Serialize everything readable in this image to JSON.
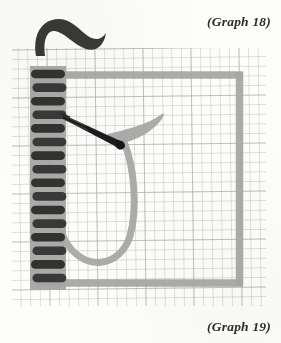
{
  "figure": {
    "kind": "embroidery-stitch-diagram",
    "label_top": "(Graph 18)",
    "label_bottom": "(Graph 19)",
    "background_color": "#fdfdfc"
  },
  "grid": {
    "x": 12,
    "y": 48,
    "width": 254,
    "height": 258,
    "cell": 9.6,
    "line_color": "#b9b8b6",
    "line_color_strong": "#9a9997"
  },
  "frame": {
    "name": "gray-thread-frame",
    "color": "#a9a8a6",
    "stroke_width": 7,
    "left": 36,
    "top": 72,
    "right": 243,
    "bottom": 285
  },
  "stitch_column": {
    "name": "blanket-stitch-column",
    "band_color": "#a9a8a6",
    "stitch_color": "#2b2a28",
    "band_x": 30,
    "band_width": 36,
    "band_top": 66,
    "band_bottom": 290,
    "count": 16,
    "first_y": 74,
    "spacing": 13.6,
    "stitch_width": 34,
    "stitch_height": 8.6
  },
  "needle": {
    "name": "sewing-needle",
    "color": "#1d1c1b",
    "eye_color": "#3a3937",
    "x1": 64,
    "y1": 116,
    "x2": 122,
    "y2": 146
  },
  "threads": [
    {
      "name": "thread-tail-top",
      "color": "#3a3937"
    },
    {
      "name": "thread-loop-curve",
      "color": "#a9a8a6"
    },
    {
      "name": "thread-wing-right",
      "color": "#a9a8a6"
    }
  ],
  "colors": {
    "ink_dark": "#2b2a28",
    "thread_gray": "#a9a8a6",
    "grid_gray": "#b9b8b6",
    "paper": "#fdfdfc",
    "label_ink": "#2e2c2a"
  }
}
